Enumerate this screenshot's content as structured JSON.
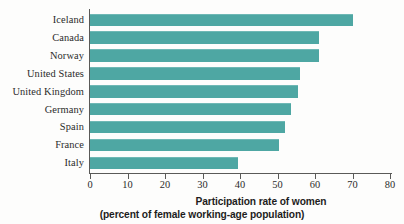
{
  "chart_data": {
    "type": "bar",
    "orientation": "horizontal",
    "title": "",
    "categories": [
      "Iceland",
      "Canada",
      "Norway",
      "United States",
      "United Kingdom",
      "Germany",
      "Spain",
      "France",
      "Italy"
    ],
    "values": [
      70,
      61,
      61,
      56,
      55.5,
      53.5,
      52,
      50.5,
      39.5
    ],
    "xlabel": "Participation rate of women (percent of female working-age population)",
    "ylabel": "",
    "xlim": [
      0,
      80
    ],
    "xticks": [
      0,
      10,
      20,
      30,
      40,
      50,
      60,
      70,
      80
    ],
    "xtick_labels": [
      "0",
      "10",
      "20",
      "30",
      "40",
      "50",
      "60",
      "70",
      "80"
    ],
    "grid": false,
    "legend": null,
    "series": [
      {
        "name": "Participation rate of women",
        "color": "#4ea7a3",
        "values": [
          70,
          61,
          61,
          56,
          55.5,
          53.5,
          52,
          50.5,
          39.5
        ]
      }
    ]
  },
  "caption": {
    "line1": "Participation rate of women",
    "line2": "(percent of female working-age population)"
  },
  "colors": {
    "bar": "#4ea7a3",
    "bar_highlight": "#6fb8b5",
    "axis": "#5a5a58",
    "text": "#2b2b2b",
    "background": "#fdfdfc"
  }
}
